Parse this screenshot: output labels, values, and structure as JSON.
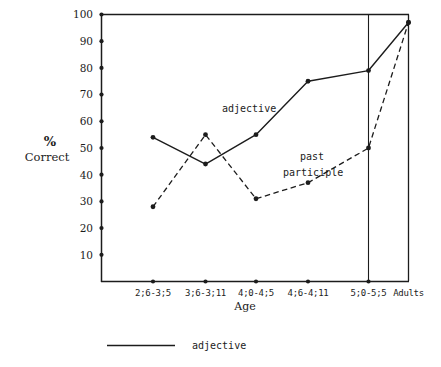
{
  "chart_data": {
    "type": "line",
    "title": "",
    "subtitle": "",
    "xlabel": "Age",
    "ylabel": "% Correct",
    "ylabel_line1": "%",
    "ylabel_line2": "Correct",
    "categories": [
      "2;6-3;5",
      "3;6-3;11",
      "4;0-4;5",
      "4;6-4;11",
      "5;0-5;5",
      "Adults"
    ],
    "ylim": [
      0,
      100
    ],
    "yticks": [
      10,
      20,
      30,
      40,
      50,
      60,
      70,
      80,
      90,
      100
    ],
    "ytick_labels": [
      "10",
      "20",
      "30",
      "40",
      "50",
      "60",
      "70",
      "80",
      "90",
      "100"
    ],
    "grid": false,
    "legend_position": "below-plot-left",
    "series": [
      {
        "name": "adjective",
        "style": "solid",
        "marker": "filled-circle",
        "color": "#1c1c1c",
        "values": [
          54,
          44,
          55,
          75,
          79,
          97
        ]
      },
      {
        "name": "past participle",
        "style": "dashed",
        "marker": "filled-circle",
        "color": "#1c1c1c",
        "values": [
          28,
          55,
          31,
          37,
          50,
          97
        ]
      }
    ],
    "annotations": [
      {
        "text": "adjective",
        "series": "adjective"
      },
      {
        "text": "past",
        "series": "past participle"
      },
      {
        "text": "participle",
        "series": "past participle"
      }
    ]
  },
  "legend": {
    "entries": [
      {
        "label": "adjective",
        "style": "solid"
      }
    ]
  },
  "axis": {
    "x_title": "Age"
  }
}
